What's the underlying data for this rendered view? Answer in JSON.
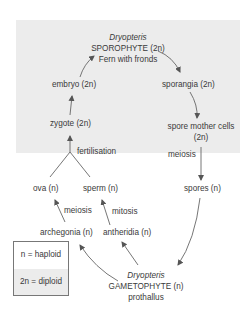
{
  "diagram": {
    "sporophyte": {
      "genus": "Dryopteris",
      "name": "SPOROPHYTE (2n)",
      "description": "Fern with fronds"
    },
    "gametophyte": {
      "genus": "Dryopteris",
      "name": "GAMETOPHYTE (n)",
      "description": "prothallus"
    },
    "stages": {
      "embryo": "embryo (2n)",
      "sporangia": "sporangia (2n)",
      "zygote": "zygote (2n)",
      "spore_mother_cells_line1": "spore mother cells",
      "spore_mother_cells_line2": "(2n)",
      "ova": "ova (n)",
      "sperm": "sperm (n)",
      "spores": "spores (n)",
      "archegonia": "archegonia (n)",
      "antheridia": "antheridia (n)"
    },
    "processes": {
      "fertilisation": "fertilisation",
      "meiosis_spores": "meiosis",
      "meiosis_ova": "meiosis",
      "mitosis_sperm": "mitosis"
    },
    "legend": {
      "haploid": "n = haploid",
      "diploid": "2n = diploid"
    },
    "colors": {
      "diploid_shade": "#ececec",
      "text": "#3a3a3a",
      "arrow": "#555555"
    }
  }
}
